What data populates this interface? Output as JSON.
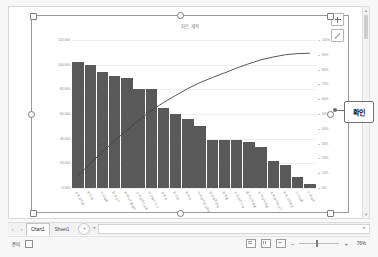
{
  "app": {
    "name": "excel-spreadsheet"
  },
  "chart": {
    "title": "차트 제목",
    "element_buttons": [
      {
        "name": "chart-elements-plus",
        "label": "+"
      },
      {
        "name": "chart-styles-brush",
        "label": "✎"
      }
    ]
  },
  "callout": {
    "label": "확인"
  },
  "chart_data": {
    "type": "bar",
    "title": "차트 제목",
    "xlabel": "",
    "ylabel": "",
    "grid": true,
    "legend_position": "none",
    "ylim": [
      0,
      120000
    ],
    "y2lim": [
      0,
      100
    ],
    "y_tick_labels": [
      "120,000",
      "100,000",
      "80,000",
      "60,000",
      "40,000",
      "20,000",
      "0.000"
    ],
    "y2_tick_labels": [
      "100%",
      "90%",
      "80%",
      "70%",
      "60%",
      "50%",
      "40%",
      "30%",
      "20%",
      "10%",
      "0%"
    ],
    "categories": [
      "자동차부품",
      "반도체",
      "석유제품",
      "합성수지",
      "평판디스플레이",
      "선박해양구조물",
      "무선통신기기",
      "자동차",
      "철강판",
      "컴퓨터",
      "석유화학중간원료",
      "정밀화학원료",
      "화장품",
      "건설광산기계",
      "플라스틱제품",
      "농약및의약품",
      "계측제어분석기",
      "원동기및펌프",
      "기구부품",
      "인쇄회로"
    ],
    "values": [
      102000,
      100000,
      94000,
      91000,
      89000,
      80000,
      80000,
      65000,
      60000,
      56000,
      50000,
      39000,
      39000,
      39000,
      37000,
      33000,
      22000,
      19000,
      9000,
      3000
    ],
    "series": [
      {
        "name": "값",
        "type": "bar",
        "values": [
          102000,
          100000,
          94000,
          91000,
          89000,
          80000,
          80000,
          65000,
          60000,
          56000,
          50000,
          39000,
          39000,
          39000,
          37000,
          33000,
          22000,
          19000,
          9000,
          3000
        ],
        "color": "#595959"
      },
      {
        "name": "누적 %",
        "type": "line",
        "axis": "secondary",
        "values": [
          8.4,
          16.6,
          24.4,
          31.9,
          39.2,
          45.8,
          52.4,
          57.7,
          62.6,
          67.2,
          71.3,
          74.6,
          77.8,
          81.0,
          84.0,
          86.7,
          88.5,
          90.1,
          90.8,
          91.1
        ],
        "color": "#444444"
      }
    ]
  },
  "tabs": {
    "prev_label": "‹",
    "next_label": "›",
    "items": [
      {
        "label": "Chart1",
        "active": true
      },
      {
        "label": "Sheet1",
        "active": false
      }
    ],
    "add_sheet_label": "+"
  },
  "status": {
    "ready_label": "준비",
    "accessibility_label": "",
    "view_buttons": [
      "normal-view",
      "page-layout-view",
      "page-break-view"
    ],
    "zoom_minus": "−",
    "zoom_plus": "+",
    "zoom_value": "76%"
  }
}
